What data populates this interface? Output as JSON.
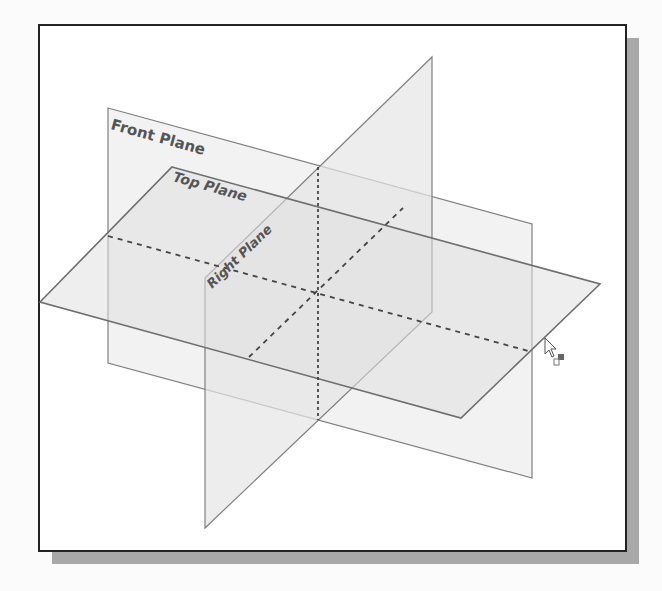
{
  "figure": {
    "frame": {
      "x": 39,
      "y": 25,
      "w": 587,
      "h": 526,
      "border": "#222222",
      "shadow": "#a8a8a8"
    },
    "planes": [
      {
        "name": "Front Plane",
        "label_pos": [
          110,
          129
        ],
        "label_angle": 15.5,
        "font_size": 15
      },
      {
        "name": "Top Plane",
        "label_pos": [
          172,
          181
        ],
        "label_angle": 15.5,
        "font_size": 14
      },
      {
        "name": "Right Plane",
        "label_pos": [
          212,
          289
        ],
        "label_angle": -44,
        "font_size": 13
      }
    ],
    "colors": {
      "plane_edge": "#7a7a7a",
      "front_fill": "#efefef",
      "top_fill": "#e2e2e2",
      "right_fill": "#e8e8e8",
      "dash": "#444444"
    },
    "cursor": {
      "x": 545,
      "y": 340,
      "icon": "pointer-with-plane-icon"
    }
  }
}
